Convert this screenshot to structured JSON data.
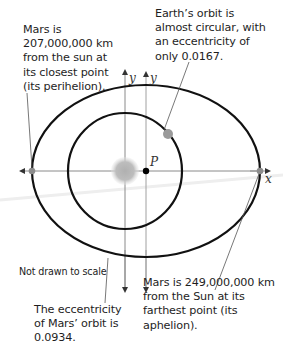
{
  "diagram": {
    "title": "",
    "annotations": {
      "perihelion": [
        "Mars is",
        "207,000,000 km",
        "from the sun at",
        "its closest point",
        "(its perihelion)."
      ],
      "earth_orbit": [
        "Earth’s orbit is",
        "almost circular, with",
        "an eccentricity of",
        "only 0.0167."
      ],
      "not_to_scale": "Not drawn to scale",
      "mars_eccentricity": [
        "The eccentricity",
        "of Mars’ orbit is",
        "0.0934."
      ],
      "aphelion": [
        "Mars is 249,000,000 km",
        "from the Sun at its",
        "farthest point (its",
        "aphelion)."
      ]
    },
    "axis_labels": {
      "y_sun": "y",
      "y_center": "y",
      "x": "x",
      "center_point": "P"
    },
    "values": {
      "mars_perihelion_km": "207,000,000",
      "mars_aphelion_km": "249,000,000",
      "earth_eccentricity": "0.0167",
      "mars_eccentricity": "0.0934"
    },
    "colors": {
      "orbit": "#111111",
      "axis": "#8a8a8a",
      "sun": "#b5b5b5",
      "planet": "#9a9a9a",
      "leader": "#555555"
    }
  }
}
